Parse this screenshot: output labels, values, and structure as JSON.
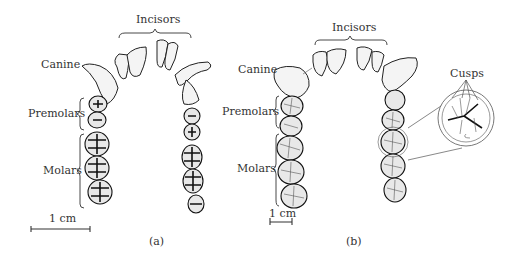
{
  "figure": {
    "panels": [
      {
        "id": "a",
        "caption": "(a)",
        "labels": {
          "incisors": "Incisors",
          "canine": "Canine",
          "premolars": "Premolars",
          "molars": "Molars"
        },
        "scale_bar": {
          "label": "1 cm",
          "length_px": 60
        }
      },
      {
        "id": "b",
        "caption": "(b)",
        "labels": {
          "incisors": "Incisors",
          "canine": "Canine",
          "premolars": "Premolars",
          "molars": "Molars",
          "cusps": "Cusps"
        },
        "scale_bar": {
          "label": "1 cm",
          "length_px": 22
        },
        "inset": {
          "name": "molar-cusp-magnifier"
        }
      }
    ]
  }
}
